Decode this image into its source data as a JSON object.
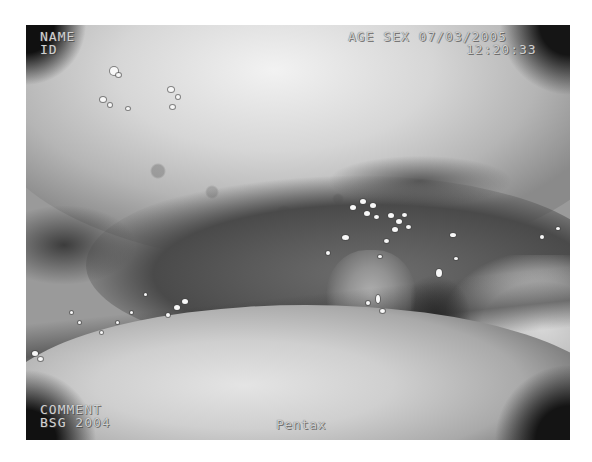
{
  "image": {
    "description": "Grayscale endoscopic view of the oral cavity showing the soft palate, uvula and dorsum of the tongue",
    "frame": {
      "left": 26,
      "top": 25,
      "width": 544,
      "height": 415
    }
  },
  "overlay": {
    "top_left": {
      "line1": "NAME",
      "line2": "ID"
    },
    "top_right": {
      "line1": "AGE SEX 07/03/2005",
      "line2": "12:20:33"
    },
    "bottom_left": {
      "line1": "COMMENT",
      "line2": "BSG 2004"
    },
    "bottom_center": {
      "label": "Pentax"
    }
  },
  "colors": {
    "background": "#ffffff",
    "overlay_text": "#d0d0d0"
  }
}
